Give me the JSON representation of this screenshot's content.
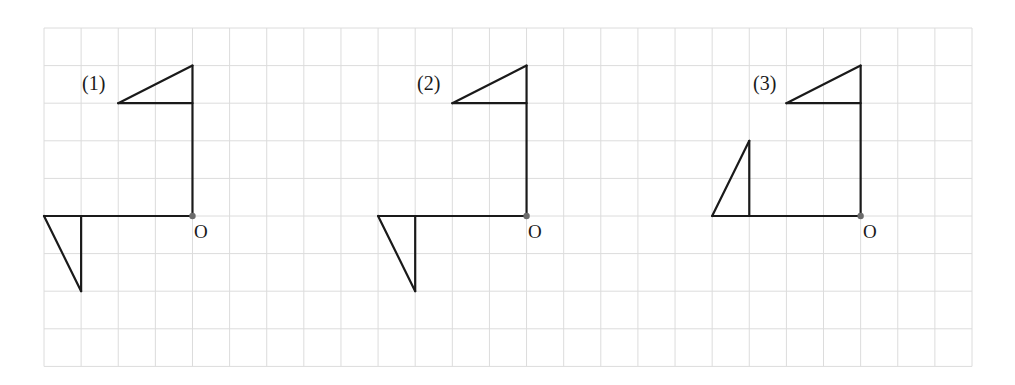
{
  "diagram": {
    "type": "grid-rotation-figures",
    "grid": {
      "left": 44,
      "top": 28,
      "cell_w": 37.12,
      "cell_h": 37.6,
      "cols": 25,
      "rows": 9,
      "line_color": "#dcdcdc"
    },
    "stroke_color": "#1a1a1a",
    "origin_dot_color": "#6b6b6b",
    "figures": [
      {
        "label": "(1)",
        "origin_label": "O",
        "origin_cell": [
          4,
          5
        ],
        "segments": [
          [
            [
              0,
              0
            ],
            [
              0,
              -4
            ]
          ],
          [
            [
              0,
              -3
            ],
            [
              -2,
              -3
            ]
          ],
          [
            [
              -2,
              -3
            ],
            [
              0,
              -4
            ]
          ],
          [
            [
              0,
              0
            ],
            [
              -4,
              0
            ]
          ],
          [
            [
              -3,
              0
            ],
            [
              -3,
              2
            ]
          ],
          [
            [
              -4,
              0
            ],
            [
              -3,
              2
            ]
          ]
        ]
      },
      {
        "label": "(2)",
        "origin_label": "O",
        "origin_cell": [
          13,
          5
        ],
        "segments": [
          [
            [
              0,
              0
            ],
            [
              0,
              -4
            ]
          ],
          [
            [
              0,
              -3
            ],
            [
              -2,
              -3
            ]
          ],
          [
            [
              -2,
              -3
            ],
            [
              0,
              -4
            ]
          ],
          [
            [
              0,
              0
            ],
            [
              -4,
              0
            ]
          ],
          [
            [
              -3,
              0
            ],
            [
              -3,
              2
            ]
          ],
          [
            [
              -4,
              0
            ],
            [
              -3,
              2
            ]
          ]
        ]
      },
      {
        "label": "(3)",
        "origin_label": "O",
        "origin_cell": [
          22,
          5
        ],
        "segments": [
          [
            [
              0,
              0
            ],
            [
              0,
              -4
            ]
          ],
          [
            [
              0,
              -3
            ],
            [
              -2,
              -3
            ]
          ],
          [
            [
              -2,
              -3
            ],
            [
              0,
              -4
            ]
          ],
          [
            [
              0,
              0
            ],
            [
              -4,
              0
            ]
          ],
          [
            [
              -3,
              0
            ],
            [
              -3,
              -2
            ]
          ],
          [
            [
              -4,
              0
            ],
            [
              -3,
              -2
            ]
          ]
        ]
      }
    ]
  },
  "labels": {
    "fig1": "(1)",
    "fig2": "(2)",
    "fig3": "(3)",
    "o1": "O",
    "o2": "O",
    "o3": "O"
  }
}
